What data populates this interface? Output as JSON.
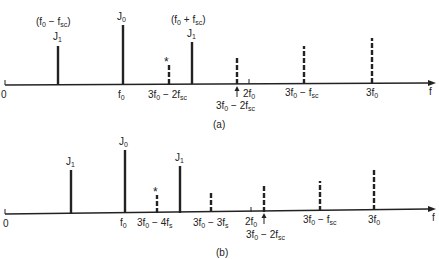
{
  "panels": [
    {
      "id": "a",
      "caption": "(a)",
      "axis_label": "f",
      "origin_label": "0",
      "top_labels": {
        "lower_sideband": "(f0 − fsc)",
        "upper_sideband": "(f0 + fsc)",
        "j1_left": "J1",
        "j0": "J0",
        "j1_right": "J1",
        "star": "*"
      },
      "axis_labels": {
        "f0": "f0",
        "third_order": "3f0 − 2fsc",
        "two_f0": "2f0",
        "arrow_label": "3f0 − 2fsc",
        "third_minus_fsc": "3f0 − fsc",
        "three_f0": "3f0"
      }
    },
    {
      "id": "b",
      "caption": "(b)",
      "axis_label": "f",
      "origin_label": "0",
      "top_labels": {
        "j1_left": "J1",
        "j0": "J0",
        "j1_right": "J1",
        "star": "*"
      },
      "axis_labels": {
        "f0": "f0",
        "third_minus_4fs": "3f0 − 4fs",
        "third_minus_3fs": "3f0 − 3fs",
        "two_f0": "2f0",
        "arrow_label": "3f0 − 2fsc",
        "third_minus_fsc": "3f0 − fsc",
        "three_f0": "3f0"
      }
    }
  ]
}
